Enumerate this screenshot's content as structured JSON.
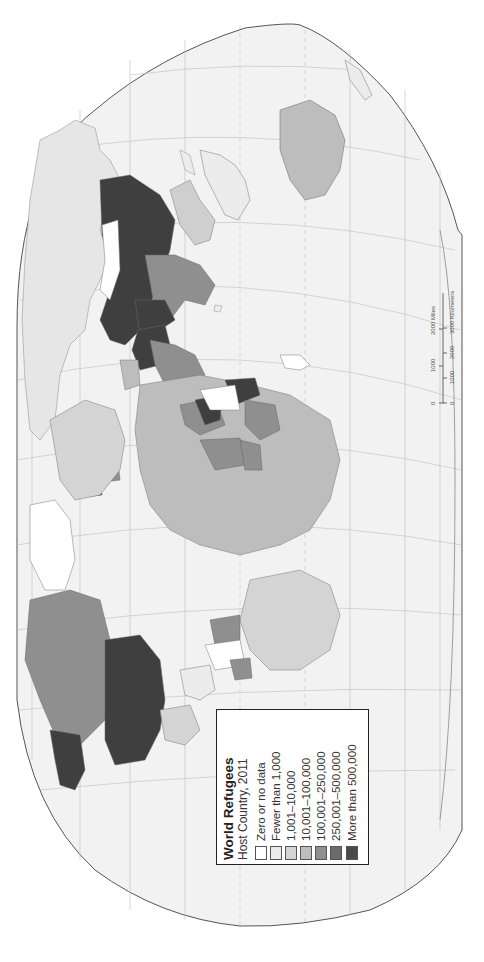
{
  "legend": {
    "title": "World Refugees",
    "subtitle": "Host Country, 2011",
    "classes": [
      {
        "label": "Zero or no data",
        "color": "#ffffff"
      },
      {
        "label": "Fewer than 1,000",
        "color": "#ececec"
      },
      {
        "label": "1,001–10,000",
        "color": "#d4d4d4"
      },
      {
        "label": "10,001–100,000",
        "color": "#bdbdbd"
      },
      {
        "label": "100,001–250,000",
        "color": "#8f8f8f"
      },
      {
        "label": "250,001–500,000",
        "color": "#6b6b6b"
      },
      {
        "label": "More than 500,000",
        "color": "#4a4a4a"
      }
    ]
  },
  "scale_bar": {
    "miles_ticks": [
      "0",
      "1000",
      "2000 Miles"
    ],
    "km_ticks": [
      "0",
      "1000",
      "2000",
      "3000 Kilometers"
    ]
  },
  "map": {
    "ocean_color": "#f2f2f2",
    "land_default_color": "#ececec",
    "graticule_color": "#b9b9b9",
    "outline_color": "#555555",
    "orientation": "rotated 90° clockwise (north at right)"
  }
}
